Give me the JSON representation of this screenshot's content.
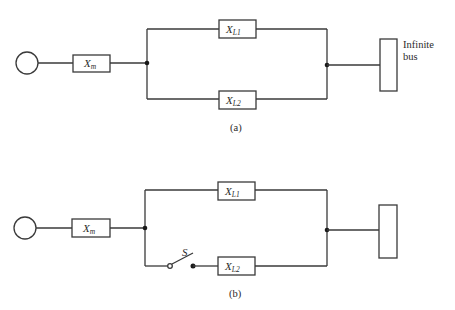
{
  "figure_a": {
    "caption": "(a)",
    "generator": "generator-symbol",
    "xm": {
      "main": "X",
      "sub": "m"
    },
    "xl1": {
      "main": "X",
      "sub": "L1"
    },
    "xl2": {
      "main": "X",
      "sub": "L2"
    },
    "bus_label_line1": "Infinite",
    "bus_label_line2": "bus"
  },
  "figure_b": {
    "caption": "(b)",
    "generator": "generator-symbol",
    "xm": {
      "main": "X",
      "sub": "m"
    },
    "xl1": {
      "main": "X",
      "sub": "L1"
    },
    "xl2": {
      "main": "X",
      "sub": "L2"
    },
    "switch_label": "S"
  }
}
